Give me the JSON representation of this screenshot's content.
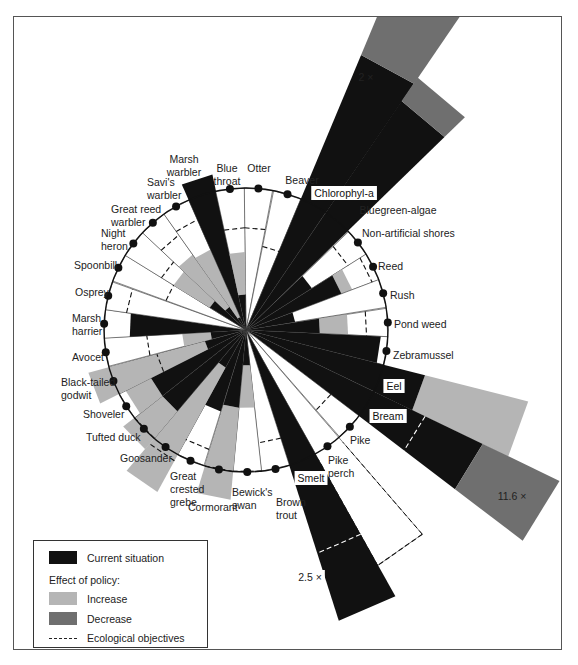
{
  "colors": {
    "current": "#111111",
    "increase": "#b5b5b5",
    "decrease": "#6f6f6f",
    "ring": "#111111",
    "divider": "#333333"
  },
  "legend": {
    "current_label": "Current situation",
    "effect_header": "Effect of policy:",
    "increase_label": "Increase",
    "decrease_label": "Decrease",
    "objective_label": "Ecological objectives"
  },
  "chart_data": {
    "type": "radial-bar (amoeba)",
    "title": "",
    "center": [
      246,
      330
    ],
    "ring_radius_px": 142,
    "angular_width_deg": 11.6,
    "units": "fraction of reference level (ring = 1.0)",
    "legend": [
      "Current situation",
      "Effect of policy: Increase",
      "Effect of policy: Decrease",
      "Ecological objectives"
    ],
    "series": [
      {
        "name": "Otter",
        "angle": 5,
        "current": 0,
        "policy_to": 0,
        "effect": "none",
        "objective": 0.72
      },
      {
        "name": "Beaver",
        "angle": 17,
        "current": 0,
        "policy_to": 0,
        "effect": "none",
        "objective": 0.6
      },
      {
        "name": "Chlorophyl-a",
        "angle": 28.5,
        "current": 2.1,
        "policy_to": 2.75,
        "effect": "decrease",
        "objective": null,
        "note": "2 ×",
        "boxed": true
      },
      {
        "name": "Bluegreen-algae",
        "angle": 40,
        "current": 1.95,
        "policy_to": 2.15,
        "effect": "decrease",
        "objective": null,
        "boxed": true
      },
      {
        "name": "Non-artificial shores",
        "angle": 52,
        "current": 0.55,
        "policy_to": 0.55,
        "effect": "none",
        "objective": 0.85
      },
      {
        "name": "Reed",
        "angle": 63.5,
        "current": 0.72,
        "policy_to": 0.8,
        "effect": "increase",
        "objective": 0.95
      },
      {
        "name": "Rush",
        "angle": 75,
        "current": 0.35,
        "policy_to": 0.35,
        "effect": "none",
        "objective": null
      },
      {
        "name": "Pond weed",
        "angle": 87,
        "current": 0.52,
        "policy_to": 0.72,
        "effect": "increase",
        "objective": 0.85
      },
      {
        "name": "Zebramussel",
        "angle": 98.5,
        "current": 0.95,
        "policy_to": 0.95,
        "effect": "none",
        "objective": null
      },
      {
        "name": "Eel",
        "angle": 110,
        "current": 1.3,
        "policy_to": 2.05,
        "effect": "increase",
        "objective": null,
        "boxed": true
      },
      {
        "name": "Bream",
        "angle": 121.5,
        "current": 1.85,
        "policy_to": 2.45,
        "effect": "decrease",
        "objective": 1.4,
        "note": "11.6 ×",
        "boxed": true
      },
      {
        "name": "Pike",
        "angle": 133,
        "current": 0,
        "policy_to": 0,
        "effect": "none",
        "objective": 0.75,
        "outline": 0.95
      },
      {
        "name": "Pike perch",
        "angle": 145,
        "current": 0,
        "policy_to": 0,
        "effect": "none",
        "objective": 1.9,
        "outline": 1.9
      },
      {
        "name": "Smelt",
        "angle": 156.5,
        "current": 2.15,
        "policy_to": 2.15,
        "effect": "none",
        "objective": 1.65,
        "note": "2.5 ×",
        "boxed": true
      },
      {
        "name": "Brown trout",
        "angle": 168,
        "current": 0,
        "policy_to": 0,
        "effect": "none",
        "objective": 0.8
      },
      {
        "name": "Bewick's swan",
        "angle": 179.5,
        "current": 0.25,
        "policy_to": 0.55,
        "effect": "increase",
        "objective": 1.0
      },
      {
        "name": "Cormorant",
        "angle": 191,
        "current": 0.55,
        "policy_to": 1.2,
        "effect": "increase",
        "objective": 1.0
      },
      {
        "name": "Great crested grebe",
        "angle": 203,
        "current": 0.6,
        "policy_to": 0.6,
        "effect": "none",
        "objective": 0.88
      },
      {
        "name": "Goosander",
        "angle": 214.5,
        "current": 0.3,
        "policy_to": 1.3,
        "effect": "increase",
        "objective": 1.05
      },
      {
        "name": "Tufted duck",
        "angle": 226,
        "current": 0.75,
        "policy_to": 1.1,
        "effect": "increase",
        "objective": 1.0
      },
      {
        "name": "Shoveler",
        "angle": 237.5,
        "current": 0.75,
        "policy_to": 0.95,
        "effect": "increase",
        "objective": null
      },
      {
        "name": "Black-tailed godwit",
        "angle": 249,
        "current": 0.3,
        "policy_to": 1.15,
        "effect": "increase",
        "objective": 0.65
      },
      {
        "name": "Avocet",
        "angle": 261,
        "current": 0.25,
        "policy_to": 0.45,
        "effect": "increase",
        "objective": 0.7
      },
      {
        "name": "Marsh harrier",
        "angle": 272.5,
        "current": 0.82,
        "policy_to": 0.82,
        "effect": "none",
        "objective": null
      },
      {
        "name": "Osprey",
        "angle": 284,
        "current": 0,
        "policy_to": 0,
        "effect": "none",
        "objective": 0.85
      },
      {
        "name": "Spoonbill",
        "angle": 296,
        "current": 0,
        "policy_to": 0,
        "effect": "none",
        "objective": 0.6
      },
      {
        "name": "Night heron",
        "angle": 307.5,
        "current": 0.3,
        "policy_to": 0.6,
        "effect": "increase",
        "objective": 0.7
      },
      {
        "name": "Great reed warbler",
        "angle": 319,
        "current": 0.2,
        "policy_to": 0.65,
        "effect": "increase",
        "objective": 0.82
      },
      {
        "name": "Savi's warbler",
        "angle": 330.5,
        "current": 0.1,
        "policy_to": 0.62,
        "effect": "increase",
        "objective": 0.85
      },
      {
        "name": "Marsh warbler",
        "angle": 342,
        "current": 1.12,
        "policy_to": 1.12,
        "effect": "none",
        "objective": null
      },
      {
        "name": "Blue throat",
        "angle": 353.5,
        "current": 0.25,
        "policy_to": 0.55,
        "effect": "increase",
        "objective": 0.72
      }
    ],
    "labels": [
      {
        "name": "Otter",
        "lines": [
          "Otter"
        ],
        "x": 259,
        "y": 172,
        "anchor": "middle"
      },
      {
        "name": "Beaver",
        "lines": [
          "Beaver"
        ],
        "x": 302,
        "y": 184,
        "anchor": "middle"
      },
      {
        "name": "Chlorophyl-a",
        "lines": [
          "Chlorophyl-a"
        ],
        "x": 344,
        "y": 197,
        "anchor": "middle",
        "boxed": true
      },
      {
        "name": "Bluegreen-algae",
        "lines": [
          "Bluegreen-algae"
        ],
        "x": 398,
        "y": 214,
        "anchor": "middle"
      },
      {
        "name": "Non-artificial shores",
        "lines": [
          "Non-artificial shores"
        ],
        "x": 362,
        "y": 237,
        "anchor": "start"
      },
      {
        "name": "Reed",
        "lines": [
          "Reed"
        ],
        "x": 378,
        "y": 270,
        "anchor": "start"
      },
      {
        "name": "Rush",
        "lines": [
          "Rush"
        ],
        "x": 390,
        "y": 299,
        "anchor": "start"
      },
      {
        "name": "Pond weed",
        "lines": [
          "Pond weed"
        ],
        "x": 394,
        "y": 328,
        "anchor": "start"
      },
      {
        "name": "Zebramussel",
        "lines": [
          "Zebramussel"
        ],
        "x": 393,
        "y": 359,
        "anchor": "start"
      },
      {
        "name": "Eel",
        "lines": [
          "Eel"
        ],
        "x": 394,
        "y": 390,
        "anchor": "middle",
        "boxed": true
      },
      {
        "name": "Bream",
        "lines": [
          "Bream"
        ],
        "x": 388,
        "y": 420,
        "anchor": "middle",
        "boxed": true
      },
      {
        "name": "Pike",
        "lines": [
          "Pike"
        ],
        "x": 350,
        "y": 444,
        "anchor": "start"
      },
      {
        "name": "Pike perch",
        "lines": [
          "Pike",
          "perch"
        ],
        "x": 328,
        "y": 464,
        "anchor": "start"
      },
      {
        "name": "Smelt",
        "lines": [
          "Smelt"
        ],
        "x": 311,
        "y": 482,
        "anchor": "middle",
        "boxed": true
      },
      {
        "name": "Brown trout",
        "lines": [
          "Brown",
          "trout"
        ],
        "x": 276,
        "y": 506,
        "anchor": "start"
      },
      {
        "name": "Bewick's swan",
        "lines": [
          "Bewick's",
          "swan"
        ],
        "x": 232,
        "y": 496,
        "anchor": "start"
      },
      {
        "name": "Cormorant",
        "lines": [
          "Cormorant"
        ],
        "x": 188,
        "y": 511,
        "anchor": "start"
      },
      {
        "name": "Great crested grebe",
        "lines": [
          "Great",
          "crested",
          "grebe"
        ],
        "x": 170,
        "y": 480,
        "anchor": "start"
      },
      {
        "name": "Goosander",
        "lines": [
          "Goosander"
        ],
        "x": 120,
        "y": 462,
        "anchor": "start"
      },
      {
        "name": "Tufted duck",
        "lines": [
          "Tufted duck"
        ],
        "x": 86,
        "y": 441,
        "anchor": "start"
      },
      {
        "name": "Shoveler",
        "lines": [
          "Shoveler"
        ],
        "x": 83,
        "y": 418,
        "anchor": "start"
      },
      {
        "name": "Black-tailed godwit",
        "lines": [
          "Black-tailed",
          "godwit"
        ],
        "x": 61,
        "y": 386,
        "anchor": "start"
      },
      {
        "name": "Avocet",
        "lines": [
          "Avocet"
        ],
        "x": 72,
        "y": 361,
        "anchor": "start"
      },
      {
        "name": "Marsh harrier",
        "lines": [
          "Marsh",
          "harrier"
        ],
        "x": 72,
        "y": 322,
        "anchor": "start"
      },
      {
        "name": "Osprey",
        "lines": [
          "Osprey"
        ],
        "x": 75,
        "y": 296,
        "anchor": "start"
      },
      {
        "name": "Spoonbill",
        "lines": [
          "Spoonbill"
        ],
        "x": 74,
        "y": 269,
        "anchor": "start"
      },
      {
        "name": "Night heron",
        "lines": [
          "Night",
          "heron"
        ],
        "x": 101,
        "y": 237,
        "anchor": "start"
      },
      {
        "name": "Great reed warbler",
        "lines": [
          "Great reed",
          "warbler"
        ],
        "x": 111,
        "y": 213,
        "anchor": "start"
      },
      {
        "name": "Savi's warbler",
        "lines": [
          "Savi's",
          "warbler"
        ],
        "x": 147,
        "y": 186,
        "anchor": "start"
      },
      {
        "name": "Marsh warbler",
        "lines": [
          "Marsh",
          "warbler"
        ],
        "x": 184,
        "y": 163,
        "anchor": "middle"
      },
      {
        "name": "Blue throat",
        "lines": [
          "Blue",
          "throat"
        ],
        "x": 227,
        "y": 172,
        "anchor": "middle"
      }
    ],
    "annotations": [
      {
        "text": "2 ×",
        "x": 366,
        "y": 81,
        "boxed": false
      },
      {
        "text": "11.6 ×",
        "x": 512,
        "y": 500,
        "boxed": false
      },
      {
        "text": "2.5 ×",
        "x": 310,
        "y": 581,
        "boxed": true
      }
    ]
  }
}
